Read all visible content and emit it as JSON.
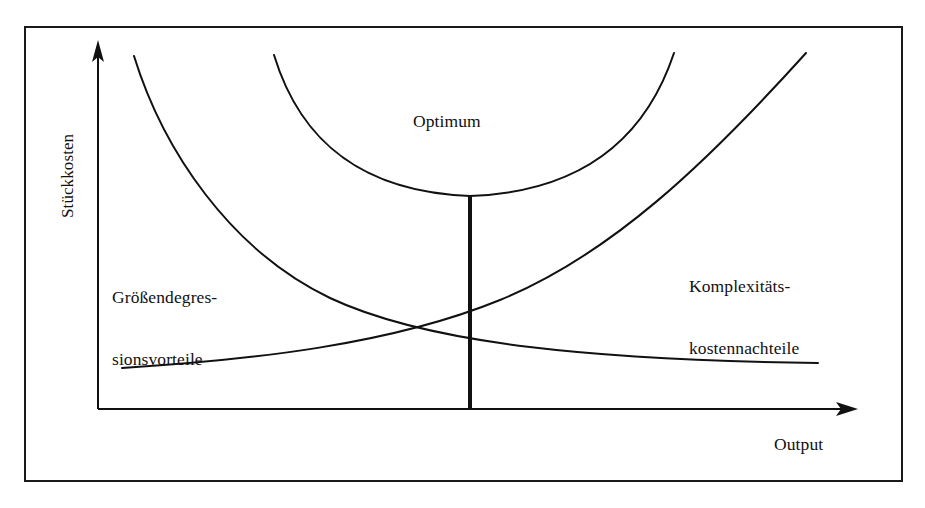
{
  "figure": {
    "name": "unit-cost-vs-output-optimum-diagram",
    "background_color": "#ffffff",
    "ink_color": "#111111",
    "frame": {
      "name": "figure-border",
      "x": 24,
      "y": 26,
      "width": 878,
      "height": 455,
      "stroke_color": "#1a1a1a",
      "stroke_width": 2
    }
  },
  "axes": {
    "y_axis": {
      "label": "Stückkosten",
      "orientation": "vertical",
      "arrow": true,
      "x": 98,
      "y_top": 45,
      "y_bottom": 409
    },
    "x_axis": {
      "label": "Output",
      "orientation": "horizontal",
      "arrow": true,
      "y": 409,
      "x_left": 98,
      "x_right": 855
    }
  },
  "labels": {
    "optimum": "Optimum",
    "scale_economies_line1": "Größendegres-",
    "scale_economies_line2": "sionsvorteile",
    "complexity_costs_line1": "Komplexitäts-",
    "complexity_costs_line2": "kostennachteile"
  },
  "chart_data": {
    "type": "line",
    "title": "",
    "xlabel": "Output",
    "ylabel": "Stückkosten",
    "grid": false,
    "legend": "none",
    "axis_tick_labels": [],
    "annotations": [
      {
        "text": "Optimum",
        "x": 414,
        "y": 113
      },
      {
        "text": "Größendegres- sionsvorteile",
        "x": 113,
        "y": 250
      },
      {
        "text": "Komplexitäts- kostennachteile",
        "x": 690,
        "y": 238
      }
    ],
    "series": [
      {
        "name": "Größendegressionsvorteile (declining unit costs)",
        "description": "Falling hyperbola: economies of scale reduce unit costs as output grows",
        "path": "M 134 56 C 163 150 230 250 330 298 C 430 345 600 360 818 363",
        "start": [
          134,
          56
        ],
        "end": [
          818,
          363
        ],
        "stroke_width": 2
      },
      {
        "name": "Komplexitätskostennachteile (rising unit costs)",
        "description": "Rising curve: complexity costs increase unit costs as output grows",
        "path": "M 122 368 C 250 360 390 345 500 300 C 610 255 705 165 806 53",
        "start": [
          122,
          368
        ],
        "end": [
          806,
          53
        ],
        "stroke_width": 2
      },
      {
        "name": "Gesamtstückkosten (total unit cost U-curve)",
        "description": "U-shaped total unit cost curve with minimum at the optimum output",
        "path": "M 274 55 C 300 140 360 192 470 196 C 580 192 645 140 674 53",
        "start": [
          274,
          55
        ],
        "minimum": [
          470,
          196
        ],
        "end": [
          674,
          53
        ],
        "stroke_width": 2
      }
    ],
    "markers": [
      {
        "name": "optimum-vertical-line",
        "description": "Thick vertical drop line from the U-curve minimum to the output axis marking the optimum output level",
        "x": 470,
        "y_top": 196,
        "y_bottom": 409,
        "stroke_width": 4
      },
      {
        "name": "curve-intersection",
        "description": "Point where the scale-economies curve crosses the complexity-cost curve",
        "x": 470,
        "y": 324
      }
    ]
  }
}
